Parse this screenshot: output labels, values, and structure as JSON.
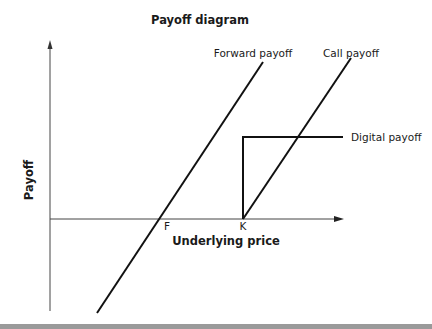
{
  "title": "Payoff diagram",
  "axes": {
    "x_label": "Underlying price",
    "y_label": "Payoff"
  },
  "ticks": {
    "forward_price": "F",
    "strike": "K"
  },
  "series": [
    {
      "name": "Forward payoff",
      "shape": "straight line with positive slope, crossing zero at F"
    },
    {
      "name": "Call payoff",
      "shape": "zero below K, rising linearly above K"
    },
    {
      "name": "Digital payoff",
      "shape": "zero below K, constant positive level above K"
    }
  ],
  "legend_labels": {
    "forward": "Forward payoff",
    "call": "Call payoff",
    "digital": "Digital payoff"
  },
  "colors": {
    "lines": "#111111",
    "axes": "#444444",
    "bottom_bar": "#9a9a9a"
  }
}
